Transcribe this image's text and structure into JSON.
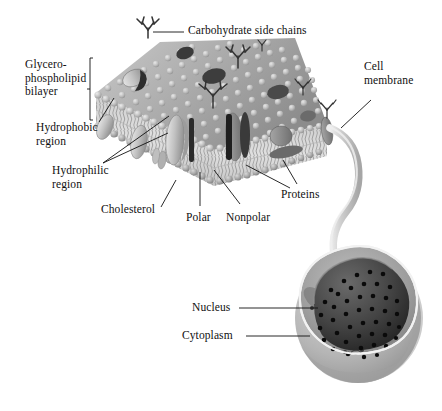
{
  "figure": {
    "background_color": "#ffffff",
    "width": 442,
    "height": 411
  },
  "palette": {
    "line": "#1a1a1a",
    "membrane_surface_light": "#c8c8c8",
    "membrane_surface_mid": "#a8a8a8",
    "membrane_surface_dark": "#8e8e8e",
    "lipid_head": "#bdbdbd",
    "lipid_head_highlight": "#e2e2e2",
    "lipid_tail": "#9a9a9a",
    "bilayer_core": "#d4d4d4",
    "protein_light": "#c2c2c2",
    "protein_mid": "#8a8a8a",
    "protein_dark": "#4a4a4a",
    "carbohydrate": "#3d3d3d",
    "cell_outer": "#b9b9b9",
    "cell_outer_shadow": "#9d9d9d",
    "cytoplasm": "#9e9e9e",
    "cytoplasm_light": "#bcbcbc",
    "nucleus": "#4c4c4c",
    "nucleus_dark": "#2b2b2b",
    "nuclear_pore": "#0d0d0d",
    "tether": "#cfcfcf"
  },
  "labels": {
    "carbohydrate_side_chains": "Carbohydrate side chains",
    "glycerophospholipid_bilayer": "Glycero-\nphospholipid\nbilayer",
    "cell_membrane": "Cell\nmembrane",
    "hydrophobic_region": "Hydrophobic\nregion",
    "hydrophilic_region": "Hydrophilic\nregion",
    "cholesterol": "Cholesterol",
    "polar": "Polar",
    "nonpolar": "Nonpolar",
    "proteins": "Proteins",
    "nucleus": "Nucleus",
    "cytoplasm": "Cytoplasm"
  },
  "structures": {
    "membrane_slab": "fluid-mosaic phospholipid bilayer slab shown in 3D cutaway",
    "lipid_head_rows": 2,
    "carbohydrate_chain_count": 6,
    "protein_count": 9,
    "cell": "cutaway animal cell with nucleus and cytoplasm",
    "nuclear_pore_count": 54,
    "tether": "curved band connecting membrane magnification to cell surface"
  }
}
